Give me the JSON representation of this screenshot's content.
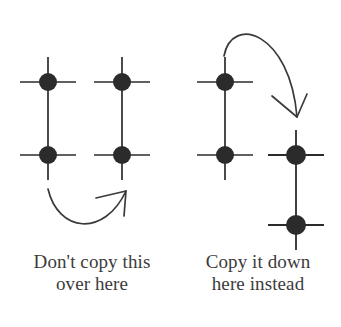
{
  "figure": {
    "background_color": "#ffffff",
    "stroke_color": "#2b2b2b",
    "dot_color": "#2b2b2b",
    "text_color": "#3b3b3b"
  },
  "captions": {
    "left": {
      "line1": "Don't copy this",
      "line2": "over here",
      "full": "Don't copy this\nover here"
    },
    "right": {
      "line1": "Copy it down",
      "line2": "here instead",
      "full": "Copy it down\nhere instead"
    }
  },
  "diagram": {
    "left_panel": {
      "label": "incorrect-example",
      "columns": [
        {
          "name": "column-a",
          "x": 48,
          "vertical_line": {
            "y_top": 57,
            "y_bottom": 180
          },
          "nodes": [
            {
              "name": "node-top",
              "x": 48,
              "y": 82,
              "radius": 9,
              "arm_half_length": 28
            },
            {
              "name": "node-bottom",
              "x": 48,
              "y": 155,
              "radius": 9,
              "arm_half_length": 28
            }
          ]
        },
        {
          "name": "column-b",
          "x": 122,
          "vertical_line": {
            "y_top": 57,
            "y_bottom": 180
          },
          "nodes": [
            {
              "name": "node-top",
              "x": 122,
              "y": 82,
              "radius": 9,
              "arm_half_length": 28
            },
            {
              "name": "node-bottom",
              "x": 122,
              "y": 155,
              "radius": 9,
              "arm_half_length": 28
            }
          ]
        }
      ],
      "arrow": {
        "name": "arrow-sideways-rejected",
        "start": {
          "x": 48,
          "y": 189
        },
        "control1": {
          "x": 58,
          "y": 232
        },
        "control2": {
          "x": 104,
          "y": 238
        },
        "end": {
          "x": 126,
          "y": 191
        },
        "direction": "left-to-right-u-curve"
      }
    },
    "right_panel": {
      "label": "correct-example",
      "columns": [
        {
          "name": "column-c",
          "x": 225,
          "vertical_line": {
            "y_top": 57,
            "y_bottom": 180
          },
          "nodes": [
            {
              "name": "node-top",
              "x": 225,
              "y": 82,
              "radius": 9,
              "arm_half_length": 28
            },
            {
              "name": "node-bottom",
              "x": 225,
              "y": 155,
              "radius": 9,
              "arm_half_length": 28
            }
          ]
        },
        {
          "name": "column-d",
          "x": 296,
          "vertical_line": {
            "y_top": 130,
            "y_bottom": 250
          },
          "nodes": [
            {
              "name": "node-upper",
              "x": 296,
              "y": 155,
              "radius": 10,
              "arm_half_length": 28
            },
            {
              "name": "node-lower",
              "x": 296,
              "y": 225,
              "radius": 10,
              "arm_half_length": 28
            }
          ]
        }
      ],
      "arrow": {
        "name": "arrow-downward-accepted",
        "start": {
          "x": 224,
          "y": 56
        },
        "control1": {
          "x": 232,
          "y": 14
        },
        "control2": {
          "x": 290,
          "y": 32
        },
        "end": {
          "x": 297,
          "y": 117
        },
        "direction": "over-the-top-descending"
      }
    }
  }
}
